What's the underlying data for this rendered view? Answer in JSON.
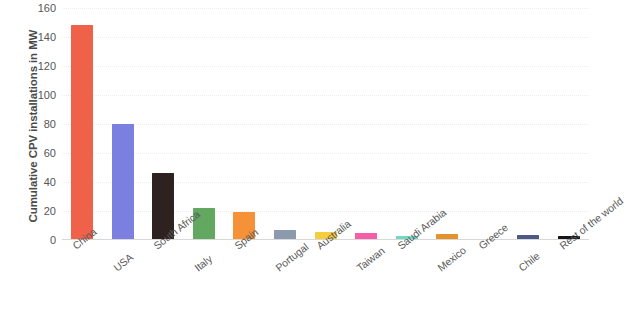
{
  "chart_data": {
    "type": "bar",
    "title": "",
    "subtitle": "",
    "xlabel": "",
    "ylabel": "Cumulative CPV installations in MW",
    "ylim": [
      0,
      160
    ],
    "ytick_labels": [
      "160",
      "140",
      "120",
      "100",
      "80",
      "60",
      "40",
      "20",
      "0"
    ],
    "ytick_values": [
      160,
      140,
      120,
      100,
      80,
      60,
      40,
      20,
      0
    ],
    "grid": true,
    "grid_axis": "y",
    "legend": false,
    "legend_position": "none",
    "categories": [
      "China",
      "USA",
      "South Africa",
      "Italy",
      "Spain",
      "Portugal",
      "Australia",
      "Taiwan",
      "Saudi Arabia",
      "Mexico",
      "Greece",
      "Chile",
      "Rest of the world"
    ],
    "values": [
      148,
      80,
      46,
      22,
      19,
      7,
      5.5,
      4.5,
      3,
      4,
      1,
      3.5,
      3
    ],
    "colors": [
      "#f0614a",
      "#7b7fe0",
      "#2e2220",
      "#62a860",
      "#f59136",
      "#8b9aac",
      "#f5ce3e",
      "#f55fa8",
      "#6fd9c2",
      "#e5922a",
      "#fbe9d2",
      "#4e5a86",
      "#161616"
    ]
  }
}
